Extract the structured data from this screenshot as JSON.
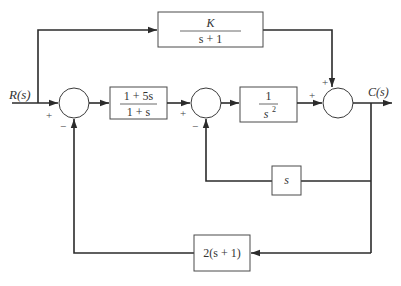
{
  "diagram": {
    "type": "block-diagram",
    "input_label": "R(s)",
    "output_label": "C(s)",
    "blocks": {
      "feedforward": {
        "numerator": "K",
        "denominator": "s + 1"
      },
      "controller": {
        "numerator": "1 + 5s",
        "denominator": "1 + s"
      },
      "plant": {
        "numerator": "1",
        "denominator": "s",
        "denominator_exp": "2"
      },
      "inner_feedback": {
        "label": "s"
      },
      "outer_feedback": {
        "label": "2(s + 1)"
      }
    },
    "summing_junctions": [
      {
        "id": "sum1",
        "signs": {
          "left": "+",
          "bottom": "−"
        }
      },
      {
        "id": "sum2",
        "signs": {
          "left": "+",
          "bottom": "−"
        }
      },
      {
        "id": "sum3",
        "signs": {
          "left": "+",
          "top": "+"
        }
      }
    ]
  }
}
